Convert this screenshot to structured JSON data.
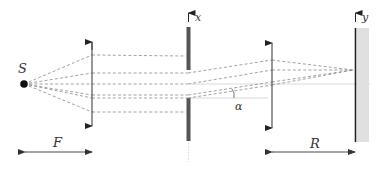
{
  "diagram": {
    "labels": {
      "source": "S",
      "slit_axis": "x",
      "screen_axis": "y",
      "angle": "α",
      "focal_length": "F",
      "distance_to_screen": "R"
    },
    "colors": {
      "ray": "#8a8a8a",
      "slit_plate": "#555555",
      "screen": "#222222",
      "screen_band": "#e0e0e0",
      "lens": "#444444"
    }
  }
}
